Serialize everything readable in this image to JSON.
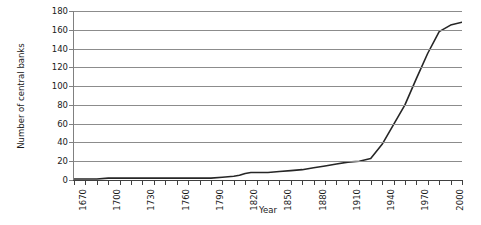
{
  "chart_data": {
    "type": "line",
    "title": "",
    "xlabel": "Year",
    "ylabel": "Number of central banks",
    "xlim": [
      1670,
      2010
    ],
    "ylim": [
      0,
      180
    ],
    "ytick_step": 20,
    "xtick_step": 10,
    "xtick_label_step": 30,
    "grid": true,
    "legend": false,
    "yticks": [
      0,
      20,
      40,
      60,
      80,
      100,
      120,
      140,
      160,
      180
    ],
    "xticks": [
      1670,
      1680,
      1690,
      1700,
      1710,
      1720,
      1730,
      1740,
      1750,
      1760,
      1770,
      1780,
      1790,
      1800,
      1810,
      1820,
      1830,
      1840,
      1850,
      1860,
      1870,
      1880,
      1890,
      1900,
      1910,
      1920,
      1930,
      1940,
      1950,
      1960,
      1970,
      1980,
      1990,
      2000,
      2010
    ],
    "xtick_labels": [
      {
        "value": 1670,
        "label": "1670"
      },
      {
        "value": 1700,
        "label": "1700"
      },
      {
        "value": 1730,
        "label": "1730"
      },
      {
        "value": 1760,
        "label": "1760"
      },
      {
        "value": 1790,
        "label": "1790"
      },
      {
        "value": 1820,
        "label": "1820"
      },
      {
        "value": 1850,
        "label": "1850"
      },
      {
        "value": 1880,
        "label": "1880"
      },
      {
        "value": 1910,
        "label": "1910"
      },
      {
        "value": 1940,
        "label": "1940"
      },
      {
        "value": 1970,
        "label": "1970"
      },
      {
        "value": 2000,
        "label": "2000"
      }
    ],
    "ytick_labels": [
      "0",
      "20",
      "40",
      "60",
      "80",
      "100",
      "120",
      "140",
      "160",
      "180"
    ],
    "series": [
      {
        "name": "Number of central banks",
        "color": "#262626",
        "x": [
          1670,
          1680,
          1690,
          1700,
          1710,
          1720,
          1730,
          1740,
          1750,
          1760,
          1770,
          1780,
          1790,
          1800,
          1810,
          1815,
          1820,
          1825,
          1830,
          1840,
          1850,
          1860,
          1870,
          1880,
          1890,
          1900,
          1910,
          1920,
          1930,
          1940,
          1950,
          1960,
          1970,
          1980,
          1990,
          2000,
          2010
        ],
        "y": [
          1,
          1,
          1,
          2,
          2,
          2,
          2,
          2,
          2,
          2,
          2,
          2,
          2,
          3,
          4,
          5,
          7,
          8,
          8,
          8,
          9,
          10,
          11,
          13,
          15,
          17,
          19,
          20,
          23,
          38,
          59,
          80,
          108,
          135,
          158,
          165,
          168
        ]
      }
    ]
  }
}
